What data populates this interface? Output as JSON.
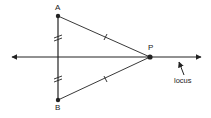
{
  "diagram": {
    "points": {
      "A": {
        "label": "A",
        "x": 58,
        "y": 16
      },
      "B": {
        "label": "B",
        "x": 58,
        "y": 100
      },
      "P": {
        "label": "P",
        "x": 150,
        "y": 57
      }
    },
    "locus_label": "locus",
    "colors": {
      "line": "#222222",
      "background": "#ffffff"
    }
  }
}
